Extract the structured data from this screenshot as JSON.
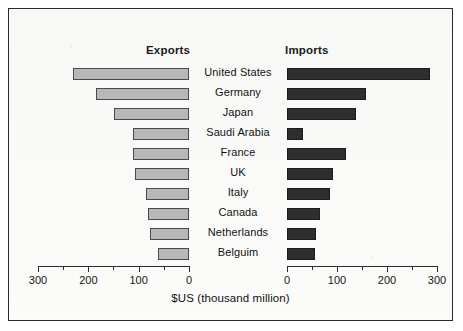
{
  "chart_data": {
    "type": "bar",
    "subtype": "back-to-back-horizontal-bar",
    "title": "",
    "xlabel": "$US (thousand million)",
    "ylabel": "",
    "grid": false,
    "legend_position": "top-as-column-headers",
    "categories": [
      "United States",
      "Germany",
      "Japan",
      "Saudi Arabia",
      "France",
      "UK",
      "Italy",
      "Canada",
      "Netherlands",
      "Belguim"
    ],
    "series": [
      {
        "name": "Exports",
        "direction": "left",
        "color": "#b8b8b8",
        "values": [
          230,
          185,
          150,
          112,
          112,
          108,
          85,
          82,
          78,
          62
        ]
      },
      {
        "name": "Imports",
        "direction": "right",
        "color": "#2e2e2e",
        "values": [
          285,
          158,
          137,
          32,
          118,
          92,
          86,
          65,
          58,
          55
        ]
      }
    ],
    "left_axis": {
      "label": "Exports",
      "ticks_major": [
        300,
        200,
        100,
        0
      ],
      "ticks_minor": [
        250,
        150,
        50
      ],
      "xlim": [
        300,
        0
      ],
      "tick_labels": [
        "300",
        "200",
        "100",
        "0"
      ]
    },
    "right_axis": {
      "label": "Imports",
      "ticks_major": [
        0,
        100,
        200,
        300
      ],
      "ticks_minor": [
        50,
        150,
        250
      ],
      "xlim": [
        0,
        300
      ],
      "tick_labels": [
        "0",
        "100",
        "200",
        "300"
      ]
    },
    "units": "thousand million $US"
  },
  "headers": {
    "exports": "Exports",
    "imports": "Imports"
  },
  "axis_title": "$US (thousand million)",
  "colors": {
    "export_bar": "#b8b8b8",
    "import_bar": "#2e2e2e",
    "frame": "#2b2b2b",
    "background": "#fbfbfa",
    "text": "#121212"
  }
}
